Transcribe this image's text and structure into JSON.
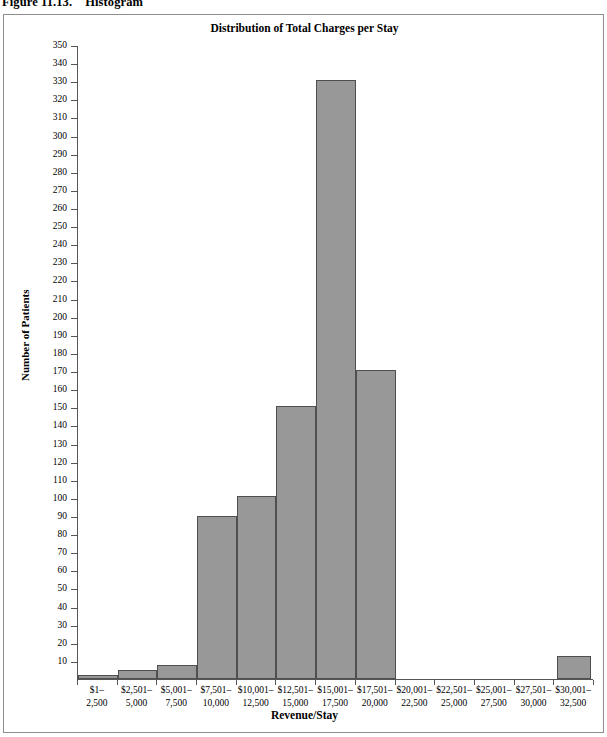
{
  "caption": {
    "label": "Figure 11.13.",
    "text": "Histogram"
  },
  "chart_data": {
    "type": "bar",
    "title": "Distribution of Total Charges per Stay",
    "xlabel": "Revenue/Stay",
    "ylabel": "Number of Patients",
    "categories": [
      "$1–\n2,500",
      "$2,501–\n5,000",
      "$5,001–\n7,500",
      "$7,501–\n10,000",
      "$10,001–\n12,500",
      "$12,501–\n15,000",
      "$15,001–\n17,500",
      "$17,501–\n20,000",
      "$20,001–\n22,500",
      "$22,501–\n25,000",
      "$25,001–\n27,500",
      "$27,501–\n30,000",
      "$30,001–\n32,500"
    ],
    "category_lines": [
      [
        "$1–",
        "2,500"
      ],
      [
        "$2,501–",
        "5,000"
      ],
      [
        "$5,001–",
        "7,500"
      ],
      [
        "$7,501–",
        "10,000"
      ],
      [
        "$10,001–",
        "12,500"
      ],
      [
        "$12,501–",
        "15,000"
      ],
      [
        "$15,001–",
        "17,500"
      ],
      [
        "$17,501–",
        "20,000"
      ],
      [
        "$20,001–",
        "22,500"
      ],
      [
        "$22,501–",
        "25,000"
      ],
      [
        "$25,001–",
        "27,500"
      ],
      [
        "$27,501–",
        "30,000"
      ],
      [
        "$30,001–",
        "32,500"
      ]
    ],
    "values": [
      2,
      5,
      8,
      90,
      101,
      151,
      331,
      171,
      0,
      0,
      0,
      0,
      13
    ],
    "ylim": [
      0,
      350
    ],
    "ytick_step": 10,
    "yticks": [
      350,
      340,
      330,
      320,
      310,
      300,
      290,
      280,
      270,
      260,
      250,
      240,
      230,
      220,
      210,
      200,
      190,
      180,
      170,
      160,
      150,
      140,
      130,
      120,
      110,
      100,
      90,
      80,
      70,
      60,
      50,
      40,
      30,
      20,
      10
    ],
    "grid": false,
    "legend": null,
    "bar_color": "#989898",
    "bar_border_color": "#4f4f4f",
    "axis_color": "#555555",
    "background": "#ffffff"
  }
}
